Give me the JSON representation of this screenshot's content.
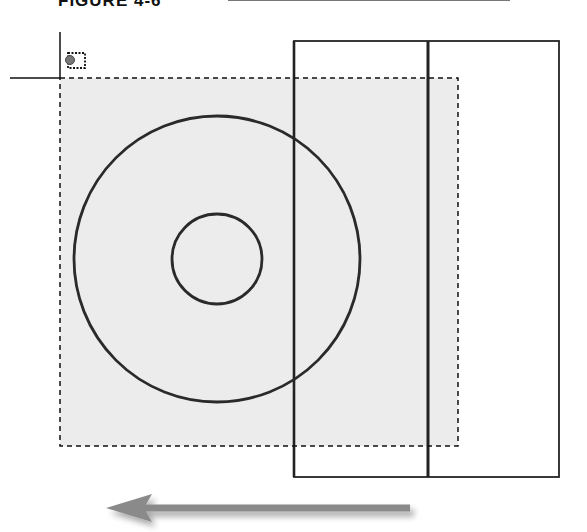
{
  "figure": {
    "title": "FIGURE 4-6"
  },
  "diagram": {
    "selection_window": {
      "style": "dashed",
      "fill": "#ededed"
    },
    "cursor": {
      "type": "crosshair",
      "icon": "selection-box-icon"
    },
    "shapes": [
      {
        "type": "circle",
        "role": "outer-circle"
      },
      {
        "type": "circle",
        "role": "inner-circle"
      },
      {
        "type": "rectangle",
        "role": "outer-rectangle"
      },
      {
        "type": "line",
        "role": "vertical-divider"
      }
    ],
    "arrow": {
      "direction": "left",
      "color": "#8a8a8a"
    }
  }
}
